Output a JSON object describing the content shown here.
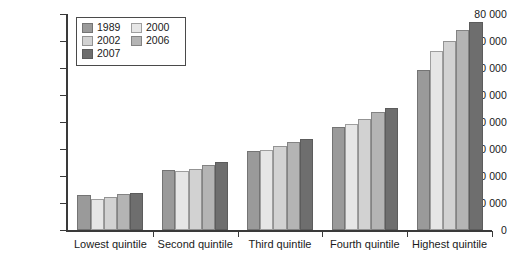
{
  "chart_data": {
    "type": "bar",
    "title": "",
    "subtitle": "",
    "xlabel": "",
    "ylabel": "",
    "grid": false,
    "legend_position": "top-left-inside",
    "categories": [
      "Lowest quintile",
      "Second quintile",
      "Third quintile",
      "Fourth quintile",
      "Highest quintile"
    ],
    "ylim": [
      0,
      80000
    ],
    "ytick_values": [
      0,
      10000,
      20000,
      30000,
      40000,
      50000,
      60000,
      70000,
      80000
    ],
    "ytick_labels": [
      "0",
      "10 000",
      "20 000",
      "30 000",
      "40 000",
      "50 000",
      "60 000",
      "70 000",
      "80 000"
    ],
    "series": [
      {
        "name": "1989",
        "color": "#9a9a9a",
        "values": [
          12800,
          22300,
          29100,
          38100,
          59200
        ]
      },
      {
        "name": "2000",
        "color": "#e6e6e6",
        "values": [
          11600,
          21900,
          29700,
          39400,
          66200
        ]
      },
      {
        "name": "2002",
        "color": "#d2d2d2",
        "values": [
          12100,
          22500,
          31000,
          41200,
          70100
        ]
      },
      {
        "name": "2006",
        "color": "#b4b4b4",
        "values": [
          13300,
          24000,
          32700,
          43600,
          74100
        ]
      },
      {
        "name": "2007",
        "color": "#6e6e6e",
        "values": [
          13800,
          25100,
          33800,
          45100,
          76900
        ]
      }
    ],
    "legend_order": [
      "1989",
      "2000",
      "2002",
      "2006",
      "2007"
    ]
  }
}
